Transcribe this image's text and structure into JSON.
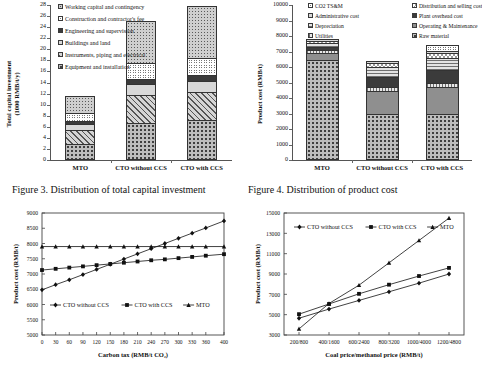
{
  "figures": {
    "fig3": {
      "caption": "Figure 3. Distribution of total capital investment",
      "ylabel_line1": "Total capital investment",
      "ylabel_line2": "(1000 RMB/t/y)"
    },
    "fig4": {
      "caption": "Figure 4. Distribution of product cost",
      "ylabel": "Product cost (RMB/t)"
    }
  },
  "chart_data": [
    {
      "id": "fig3",
      "type": "bar",
      "stacked": true,
      "title": "Figure 3. Distribution of total capital investment",
      "xlabel": "",
      "ylabel": "Total capital investment (1000 RMB/t/y)",
      "ylim": [
        0,
        28
      ],
      "yticks": [
        0,
        2,
        4,
        6,
        8,
        10,
        12,
        14,
        16,
        18,
        20,
        22,
        24,
        26,
        28
      ],
      "categories": [
        "MTO",
        "CTO without CCS",
        "CTO with CCS"
      ],
      "legend_position": "top-left",
      "grid": false,
      "series": [
        {
          "name": "Equipment and installation",
          "fill": "f-dots-coarse",
          "values": [
            2.9,
            6.6,
            7.3
          ]
        },
        {
          "name": "Instruments, piping and electrical",
          "fill": "f-diag",
          "values": [
            2.6,
            5.2,
            4.9
          ]
        },
        {
          "name": "Buildings and land",
          "fill": "f-solid-light",
          "values": [
            1.0,
            1.9,
            2.0
          ]
        },
        {
          "name": "Engineering and supervision",
          "fill": "f-solid-dark",
          "values": [
            0.5,
            1.0,
            1.1
          ]
        },
        {
          "name": "Construction and contractor's fee",
          "fill": "f-circles",
          "values": [
            1.5,
            2.9,
            3.1
          ]
        },
        {
          "name": "Working capital and contingency",
          "fill": "f-dots-fine",
          "values": [
            3.0,
            7.5,
            9.4
          ]
        }
      ]
    },
    {
      "id": "fig4",
      "type": "bar",
      "stacked": true,
      "title": "Figure 4. Distribution of product cost",
      "xlabel": "",
      "ylabel": "Product cost (RMB/t)",
      "ylim": [
        0,
        10000
      ],
      "yticks": [
        0,
        1000,
        2000,
        3000,
        4000,
        5000,
        6000,
        7000,
        8000,
        9000,
        10000
      ],
      "categories": [
        "MTO",
        "CTO without CCS",
        "CTO with CCS"
      ],
      "legend_position": "top",
      "grid": false,
      "series": [
        {
          "name": "Raw material",
          "fill": "f-dots-coarse",
          "values": [
            6450,
            2950,
            2950
          ]
        },
        {
          "name": "Operating & Maintenance",
          "fill": "f-solid-mid",
          "values": [
            480,
            1500,
            1750
          ]
        },
        {
          "name": "Utilities",
          "fill": "f-vgrid",
          "values": [
            180,
            230,
            250
          ]
        },
        {
          "name": "Plant overhead cost",
          "fill": "f-solid-dark",
          "values": [
            170,
            700,
            850
          ]
        },
        {
          "name": "Depreciation",
          "fill": "f-hgrid",
          "values": [
            300,
            620,
            780
          ]
        },
        {
          "name": "Distribution and selling cost",
          "fill": "f-checker",
          "values": [
            120,
            260,
            300
          ]
        },
        {
          "name": "Administrative cost",
          "fill": "f-solid-light",
          "values": [
            100,
            140,
            170
          ]
        },
        {
          "name": "CO2 TS&M",
          "fill": "f-circles",
          "values": [
            0,
            0,
            400
          ]
        }
      ]
    },
    {
      "id": "fig5",
      "type": "line",
      "title": "",
      "xlabel": "Carbon tax (RMB/t CO₂)",
      "ylabel": "Product cost (RMB/t)",
      "xlim": [
        0,
        400
      ],
      "ylim": [
        5000,
        9000
      ],
      "yticks": [
        5000,
        5500,
        6000,
        6500,
        7000,
        7500,
        8000,
        8500,
        9000
      ],
      "xticks": [
        0,
        30,
        60,
        90,
        120,
        150,
        180,
        210,
        240,
        270,
        300,
        330,
        360,
        400
      ],
      "legend_position": "lower-center",
      "grid": false,
      "series": [
        {
          "name": "CTO without CCS",
          "marker": "diamond",
          "x": [
            0,
            30,
            60,
            90,
            120,
            150,
            180,
            210,
            240,
            270,
            300,
            330,
            360,
            400
          ],
          "y": [
            6480,
            6650,
            6810,
            6980,
            7150,
            7320,
            7490,
            7660,
            7830,
            8000,
            8170,
            8340,
            8510,
            8740
          ]
        },
        {
          "name": "CTO with CCS",
          "marker": "square",
          "x": [
            0,
            30,
            60,
            90,
            120,
            150,
            180,
            210,
            240,
            270,
            300,
            330,
            360,
            400
          ],
          "y": [
            7130,
            7170,
            7210,
            7250,
            7290,
            7330,
            7370,
            7410,
            7450,
            7480,
            7520,
            7560,
            7600,
            7650
          ]
        },
        {
          "name": "MTO",
          "marker": "triangle",
          "x": [
            0,
            30,
            60,
            90,
            120,
            150,
            180,
            210,
            240,
            270,
            300,
            330,
            360,
            400
          ],
          "y": [
            7900,
            7900,
            7900,
            7900,
            7900,
            7900,
            7900,
            7900,
            7900,
            7900,
            7900,
            7900,
            7900,
            7900
          ]
        }
      ]
    },
    {
      "id": "fig6",
      "type": "line",
      "title": "",
      "xlabel": "Coal price/methanol price (RMB/t)",
      "ylabel": "Product cost (RMB/t)",
      "ylim": [
        3000,
        15000
      ],
      "yticks": [
        3000,
        5000,
        7000,
        9000,
        11000,
        13000,
        15000
      ],
      "xticks": [
        "200/800",
        "400/1600",
        "600/2400",
        "800/3200",
        "1000/4000",
        "1200/4800"
      ],
      "legend_position": "top",
      "grid": false,
      "series": [
        {
          "name": "CTO without CCS",
          "marker": "diamond",
          "y": [
            4650,
            5550,
            6400,
            7250,
            8100,
            9000
          ]
        },
        {
          "name": "CTO with CCS",
          "marker": "square",
          "y": [
            5050,
            6050,
            7050,
            7950,
            8800,
            9600
          ]
        },
        {
          "name": "MTO",
          "marker": "triangle",
          "y": [
            3600,
            6100,
            7900,
            10100,
            12300,
            14500
          ]
        }
      ]
    }
  ]
}
